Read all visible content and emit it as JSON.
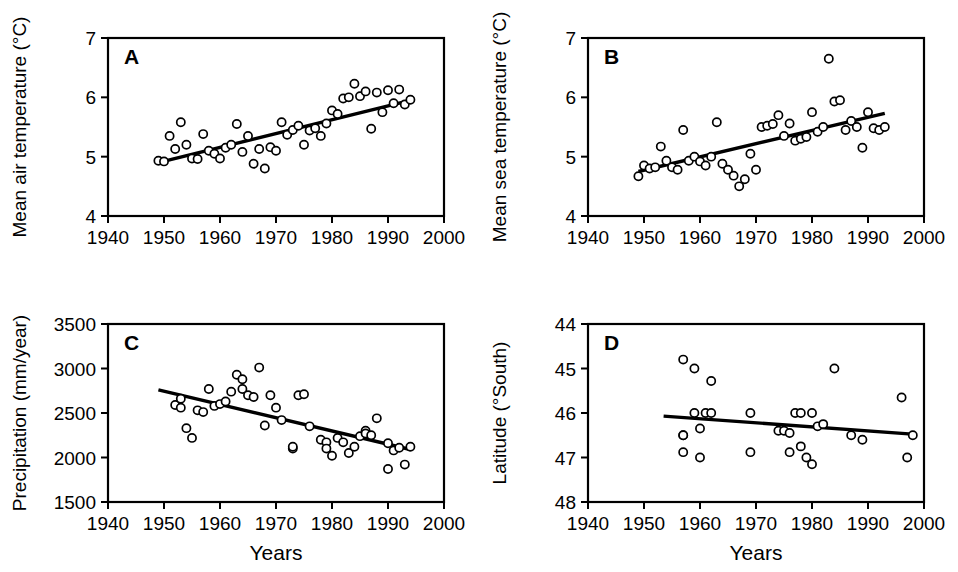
{
  "figure": {
    "panels": [
      {
        "letter": "A",
        "ylabel": "Mean air temperature (°C)",
        "xlabel": "",
        "chart_data": {
          "type": "scatter",
          "title": "",
          "xlabel": "",
          "ylabel": "Mean air temperature (°C)",
          "xlim": [
            1940,
            2000
          ],
          "ylim": [
            4,
            7
          ],
          "yticks": [
            4,
            5,
            6,
            7
          ],
          "xticks": [
            1940,
            1950,
            1960,
            1970,
            1980,
            1990,
            2000
          ],
          "y_inverted": false,
          "grid": false,
          "legend": null,
          "x": [
            1949,
            1950,
            1951,
            1952,
            1953,
            1954,
            1955,
            1956,
            1957,
            1958,
            1959,
            1960,
            1961,
            1962,
            1963,
            1964,
            1965,
            1966,
            1967,
            1968,
            1969,
            1970,
            1971,
            1972,
            1973,
            1974,
            1975,
            1976,
            1977,
            1978,
            1979,
            1980,
            1981,
            1982,
            1983,
            1984,
            1985,
            1986,
            1987,
            1988,
            1989,
            1990,
            1991,
            1992,
            1993,
            1994
          ],
          "y": [
            4.93,
            4.92,
            5.35,
            5.13,
            5.58,
            5.2,
            4.97,
            4.96,
            5.38,
            5.1,
            5.05,
            4.97,
            5.15,
            5.2,
            5.55,
            5.08,
            5.35,
            4.88,
            5.13,
            4.8,
            5.16,
            5.1,
            5.58,
            5.37,
            5.45,
            5.52,
            5.2,
            5.44,
            5.48,
            5.35,
            5.56,
            5.78,
            5.72,
            5.98,
            6.0,
            6.23,
            6.02,
            6.1,
            5.47,
            6.08,
            5.75,
            6.12,
            5.9,
            6.13,
            5.88,
            5.96
          ],
          "trendline": {
            "x": [
              1949,
              1994
            ],
            "y": [
              4.9,
              5.95
            ]
          }
        }
      },
      {
        "letter": "B",
        "ylabel": "Mean sea temperature (°C)",
        "xlabel": "",
        "chart_data": {
          "type": "scatter",
          "title": "",
          "xlabel": "",
          "ylabel": "Mean sea temperature (°C)",
          "xlim": [
            1940,
            2000
          ],
          "ylim": [
            4,
            7
          ],
          "yticks": [
            4,
            5,
            6,
            7
          ],
          "xticks": [
            1940,
            1950,
            1960,
            1970,
            1980,
            1990,
            2000
          ],
          "y_inverted": false,
          "grid": false,
          "legend": null,
          "x": [
            1949,
            1950,
            1951,
            1952,
            1953,
            1954,
            1955,
            1956,
            1957,
            1958,
            1959,
            1960,
            1961,
            1962,
            1963,
            1964,
            1965,
            1966,
            1967,
            1968,
            1969,
            1970,
            1971,
            1972,
            1973,
            1974,
            1975,
            1976,
            1977,
            1978,
            1979,
            1980,
            1981,
            1982,
            1983,
            1984,
            1985,
            1986,
            1987,
            1988,
            1989,
            1990,
            1991,
            1992,
            1993
          ],
          "y": [
            4.67,
            4.85,
            4.8,
            4.82,
            5.17,
            4.93,
            4.82,
            4.78,
            5.45,
            4.93,
            5.0,
            4.92,
            4.85,
            5.0,
            5.58,
            4.88,
            4.78,
            4.68,
            4.5,
            4.62,
            5.05,
            4.78,
            5.5,
            5.52,
            5.55,
            5.7,
            5.35,
            5.56,
            5.27,
            5.3,
            5.33,
            5.75,
            5.42,
            5.5,
            6.65,
            5.93,
            5.95,
            5.45,
            5.6,
            5.5,
            5.15,
            5.75,
            5.48,
            5.45,
            5.5
          ],
          "trendline": {
            "x": [
              1949,
              1993
            ],
            "y": [
              4.75,
              5.73
            ]
          }
        }
      },
      {
        "letter": "C",
        "ylabel": "Precipitation (mm/year)",
        "xlabel": "Years",
        "chart_data": {
          "type": "scatter",
          "title": "",
          "xlabel": "Years",
          "ylabel": "Precipitation (mm/year)",
          "xlim": [
            1940,
            2000
          ],
          "ylim": [
            1500,
            3500
          ],
          "yticks": [
            1500,
            2000,
            2500,
            3000,
            3500
          ],
          "xticks": [
            1940,
            1950,
            1960,
            1970,
            1980,
            1990,
            2000
          ],
          "y_inverted": false,
          "grid": false,
          "legend": null,
          "x": [
            1952,
            1953,
            1953,
            1954,
            1955,
            1956,
            1957,
            1958,
            1959,
            1960,
            1961,
            1962,
            1963,
            1964,
            1964,
            1965,
            1966,
            1967,
            1968,
            1969,
            1970,
            1971,
            1973,
            1973,
            1974,
            1975,
            1976,
            1978,
            1979,
            1979,
            1980,
            1981,
            1982,
            1983,
            1984,
            1985,
            1986,
            1986,
            1987,
            1988,
            1990,
            1990,
            1991,
            1992,
            1993,
            1994
          ],
          "y": [
            2590,
            2560,
            2660,
            2330,
            2220,
            2530,
            2510,
            2770,
            2580,
            2600,
            2630,
            2740,
            2930,
            2880,
            2770,
            2700,
            2680,
            3010,
            2360,
            2700,
            2560,
            2420,
            2100,
            2120,
            2700,
            2710,
            2350,
            2200,
            2170,
            2100,
            2020,
            2220,
            2170,
            2050,
            2120,
            2240,
            2300,
            2270,
            2250,
            2440,
            1870,
            2160,
            2080,
            2110,
            1920,
            2120
          ],
          "trendline": {
            "x": [
              1949,
              1994
            ],
            "y": [
              2760,
              2090
            ]
          }
        }
      },
      {
        "letter": "D",
        "ylabel": "Latitude (°South)",
        "xlabel": "Years",
        "chart_data": {
          "type": "scatter",
          "title": "",
          "xlabel": "Years",
          "ylabel": "Latitude (°South)",
          "xlim": [
            1940,
            2000
          ],
          "ylim": [
            44,
            48
          ],
          "yticks": [
            44,
            45,
            46,
            47,
            48
          ],
          "xticks": [
            1940,
            1950,
            1960,
            1970,
            1980,
            1990,
            2000
          ],
          "y_inverted": true,
          "grid": false,
          "legend": null,
          "x": [
            1957,
            1957,
            1957,
            1957,
            1959,
            1959,
            1960,
            1960,
            1961,
            1962,
            1962,
            1969,
            1969,
            1974,
            1975,
            1976,
            1976,
            1977,
            1978,
            1978,
            1979,
            1980,
            1980,
            1981,
            1982,
            1984,
            1987,
            1989,
            1996,
            1997,
            1998
          ],
          "y": [
            44.8,
            46.5,
            46.88,
            46.5,
            45.0,
            46.0,
            46.35,
            47.0,
            46.0,
            46.0,
            45.28,
            46.0,
            46.88,
            46.4,
            46.4,
            46.45,
            46.88,
            46.0,
            46.0,
            46.75,
            47.0,
            46.0,
            47.15,
            46.3,
            46.25,
            45.0,
            46.5,
            46.6,
            45.65,
            47.0,
            46.5
          ],
          "trendline": {
            "x": [
              1953.5,
              1998.5
            ],
            "y": [
              46.07,
              46.48
            ]
          }
        }
      }
    ]
  }
}
